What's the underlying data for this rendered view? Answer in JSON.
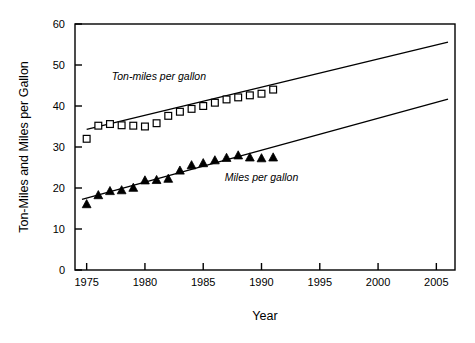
{
  "chart_data": {
    "type": "scatter",
    "title": "",
    "xlabel": "Year",
    "ylabel": "Ton-Miles and Miles per Gallon",
    "xlim": [
      1974,
      2006.6
    ],
    "ylim": [
      0,
      60
    ],
    "grid": false,
    "legend_position": "inline-annotations",
    "xticks": [
      1975,
      1980,
      1985,
      1990,
      1995,
      2000,
      2005
    ],
    "xticklabels": [
      "1975",
      "1980",
      "1985",
      "1990",
      "1995",
      "2000",
      "2005"
    ],
    "yticks": [
      0,
      10,
      20,
      30,
      40,
      50,
      60
    ],
    "yticklabels": [
      "0",
      "10",
      "20",
      "30",
      "40",
      "50",
      "60"
    ],
    "series": [
      {
        "name": "Ton-miles per gallon",
        "marker": "open-square",
        "annotation": "Ton-miles per gallon",
        "annotation_at": [
          1981.2,
          46.4
        ],
        "x": [
          1975,
          1976,
          1977,
          1978,
          1979,
          1980,
          1981,
          1982,
          1983,
          1984,
          1985,
          1986,
          1987,
          1988,
          1989,
          1990,
          1991
        ],
        "values": [
          32.0,
          35.2,
          35.6,
          35.3,
          35.2,
          35.0,
          35.8,
          37.6,
          38.6,
          39.3,
          40.0,
          40.8,
          41.6,
          42.1,
          42.6,
          43.0,
          44.0
        ],
        "trendline": {
          "x": [
            1975.0,
            2006.0
          ],
          "y": [
            34.3,
            55.6
          ]
        }
      },
      {
        "name": "Miles per gallon",
        "marker": "filled-triangle",
        "annotation": "Miles per gallon",
        "annotation_at": [
          1990.0,
          21.8
        ],
        "x": [
          1975,
          1976,
          1977,
          1978,
          1979,
          1980,
          1981,
          1982,
          1983,
          1984,
          1985,
          1986,
          1987,
          1988,
          1989,
          1990,
          1991
        ],
        "values": [
          16.1,
          18.3,
          19.3,
          19.5,
          20.1,
          21.9,
          22.0,
          22.3,
          24.3,
          25.6,
          26.1,
          26.8,
          27.4,
          28.0,
          27.5,
          27.3,
          27.5
        ],
        "trendline": {
          "x": [
            1974.6,
            2006.0
          ],
          "y": [
            17.2,
            41.7
          ]
        }
      }
    ]
  },
  "colors": {
    "axis": "#000000",
    "marker_edge": "#000000",
    "marker_fill_open": "#ffffff",
    "marker_fill_solid": "#000000",
    "background": "#ffffff"
  }
}
